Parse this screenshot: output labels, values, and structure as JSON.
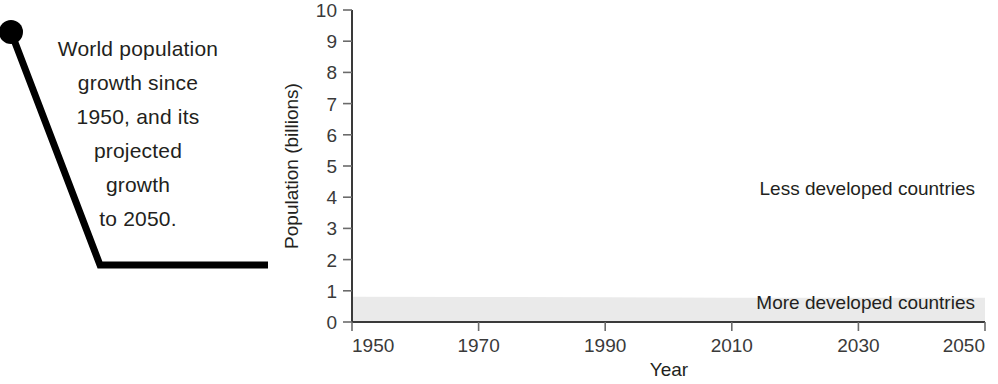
{
  "caption": {
    "lines": [
      "World population",
      "growth since",
      "1950, and its",
      "projected",
      "growth",
      "to 2050."
    ],
    "full_text": "World population growth since 1950, and its projected growth to 2050."
  },
  "chart_data": {
    "type": "area",
    "title": "",
    "subtitle": "",
    "xlabel": "Year",
    "ylabel": "Population (billions)",
    "xlim": [
      1950,
      2050
    ],
    "ylim": [
      0,
      10
    ],
    "grid": false,
    "legend_position": "inline-labels",
    "x_ticks": [
      "1950",
      "1970",
      "1990",
      "2010",
      "2030",
      "2050"
    ],
    "x_tick_values": [
      1950,
      1970,
      1990,
      2010,
      2030,
      2050
    ],
    "y_ticks": [
      "0",
      "1",
      "2",
      "3",
      "4",
      "5",
      "6",
      "7",
      "8",
      "9",
      "10"
    ],
    "y_tick_values": [
      0,
      1,
      2,
      3,
      4,
      5,
      6,
      7,
      8,
      9,
      10
    ],
    "x": [
      1950,
      1970,
      1990,
      2010,
      2030,
      2050
    ],
    "series": [
      {
        "name": "More developed countries",
        "values": [
          0.81,
          0.8,
          0.79,
          0.78,
          0.78,
          0.78
        ],
        "color": "#eaeaea",
        "label_anchor_x": 2043,
        "label_anchor_y": 0.45
      },
      {
        "name": "Less developed countries",
        "values": [
          0,
          0,
          0,
          0,
          0,
          0
        ],
        "color": "#ffffff",
        "label_anchor_x": 2027,
        "label_anchor_y": 4.3
      }
    ],
    "annotations": [
      {
        "text": "Less developed countries",
        "x": 2027,
        "y": 4.3
      },
      {
        "text": "More developed countries",
        "x": 2043,
        "y": 0.45
      }
    ],
    "colors": {
      "more_developed_band": "#eaeaea",
      "less_developed_band": "#ffffff",
      "axis": "#3a3a3a",
      "text": "#231f20"
    }
  }
}
